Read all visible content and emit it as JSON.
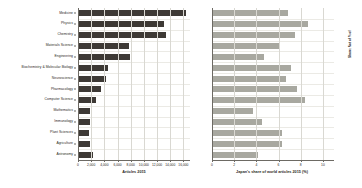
{
  "chart_data": [
    {
      "type": "bar",
      "orientation": "horizontal",
      "title": "",
      "xlabel": "Articles 2015",
      "ylabel": "",
      "xlim": [
        0,
        17000
      ],
      "grid": true,
      "bar_color": "#3d3935",
      "xticks": [
        0,
        2000,
        4000,
        6000,
        8000,
        10000,
        12000,
        14000,
        16000
      ],
      "xticklabels": [
        "0",
        "2,000",
        "4,000",
        "6,000",
        "8,000",
        "10,000",
        "12,000",
        "14,000",
        "16,000"
      ],
      "categories": [
        "Medicine",
        "Physics",
        "Chemistry",
        "Materials Science",
        "Engineering",
        "Biochemistry & Molecular Biology",
        "Neuroscience",
        "Pharmacology",
        "Computer Science",
        "Mathematics",
        "Immunology",
        "Plant Sciences",
        "Agriculture",
        "Astronomy"
      ],
      "values": [
        16200,
        12900,
        13200,
        7600,
        7700,
        4400,
        4100,
        3300,
        2600,
        1700,
        1600,
        1500,
        1700,
        2100
      ]
    },
    {
      "type": "bar",
      "orientation": "horizontal",
      "title": "",
      "xlabel": "Japan's share of world articles 2015 (%)",
      "ylabel": "Share: Not of % of",
      "xlim": [
        0,
        11
      ],
      "grid": true,
      "bar_color": "#a8a8a0",
      "xticks": [
        0,
        2,
        4,
        6,
        8,
        10
      ],
      "xticklabels": [
        "0",
        "2",
        "4",
        "6",
        "8",
        "10"
      ],
      "categories": [
        "Medicine",
        "Physics",
        "Chemistry",
        "Materials Science",
        "Engineering",
        "Biochemistry & Molecular Biology",
        "Neuroscience",
        "Pharmacology",
        "Computer Science",
        "Mathematics",
        "Immunology",
        "Plant Sciences",
        "Agriculture",
        "Astronomy"
      ],
      "values": [
        6.8,
        8.6,
        7.4,
        6.0,
        4.6,
        7.0,
        6.6,
        7.6,
        8.3,
        3.6,
        4.4,
        6.2,
        6.2,
        4.1,
        7.2
      ]
    }
  ],
  "left": {
    "axis_title": "Articles 2015"
  },
  "right": {
    "axis_title": "Japan's share of world articles 2015 (%)",
    "vertical_title": "Share: Not of % of"
  }
}
